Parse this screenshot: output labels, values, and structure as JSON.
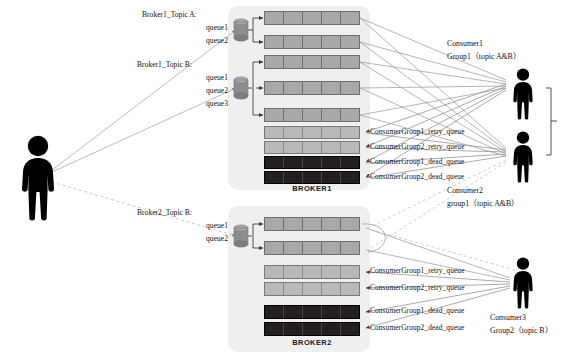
{
  "diagram": {
    "colors": {
      "broker_background": "#efeff0",
      "topic_queue_fill": "#a9a9a9",
      "retry_queue_fill": "#b9b9b9",
      "dead_queue_fill": "#231f20",
      "queue_border": "#6d6d6d",
      "person_fill": "#000000",
      "connector_line": "#9a9a9a",
      "text": "#111111"
    }
  },
  "producer": {
    "name": "producer-person-icon"
  },
  "topics": [
    {
      "id": "broker1-topic-a",
      "title": "Broker1_Topic A:",
      "queues": [
        "queue1",
        "queue2"
      ]
    },
    {
      "id": "broker1-topic-b",
      "title": "Broker1_Topic B:",
      "queues": [
        "queue1",
        "queue2",
        "queue3"
      ]
    },
    {
      "id": "broker2-topic-b",
      "title": "Broker2_Topic B:",
      "queues": [
        "queue1",
        "queue2"
      ]
    }
  ],
  "brokers": [
    {
      "id": "broker1",
      "label": "BROKER1",
      "bars": [
        {
          "kind": "topic",
          "cells": 5,
          "tag": ""
        },
        {
          "kind": "topic",
          "cells": 5,
          "tag": ""
        },
        {
          "kind": "topic",
          "cells": 5,
          "tag": ""
        },
        {
          "kind": "topic",
          "cells": 5,
          "tag": ""
        },
        {
          "kind": "topic",
          "cells": 5,
          "tag": ""
        },
        {
          "kind": "retry",
          "cells": 5,
          "tag": "ConsumerGroup1_retry_queue"
        },
        {
          "kind": "retry",
          "cells": 5,
          "tag": "ConsumerGroup2_retry_queue"
        },
        {
          "kind": "dead",
          "cells": 5,
          "tag": "ConsumerGroup1_dead_queue"
        },
        {
          "kind": "dead",
          "cells": 5,
          "tag": "ConsumerGroup2_dead_queue"
        }
      ]
    },
    {
      "id": "broker2",
      "label": "BROKER2",
      "bars": [
        {
          "kind": "topic",
          "cells": 5,
          "tag": ""
        },
        {
          "kind": "topic",
          "cells": 5,
          "tag": ""
        },
        {
          "kind": "retry",
          "cells": 5,
          "tag": "ConsumerGroup1_retry_queue"
        },
        {
          "kind": "retry",
          "cells": 5,
          "tag": "ConsumerGroup2_retry_queue"
        },
        {
          "kind": "dead",
          "cells": 5,
          "tag": "ConsumerGroup1_dead_queue"
        },
        {
          "kind": "dead",
          "cells": 5,
          "tag": "ConsumerGroup2_dead_queue"
        }
      ]
    }
  ],
  "consumers": [
    {
      "id": "consumer1",
      "name": "Consumer1",
      "group": "Group1（topic A&B）"
    },
    {
      "id": "consumer2",
      "name": "Consumer2",
      "group": "group1（topic A&B）"
    },
    {
      "id": "consumer3",
      "name": "Consumer3",
      "group": "Group2（topic B）"
    }
  ],
  "queue_tags": {
    "b1_retry1": "ConsumerGroup1_retry_queue",
    "b1_retry2": "ConsumerGroup2_retry_queue",
    "b1_dead1": "ConsumerGroup1_dead_queue",
    "b1_dead2": "ConsumerGroup2_dead_queue",
    "b2_retry1": "ConsumerGroup1_retry_queue",
    "b2_retry2": "ConsumerGroup2_retry_queue",
    "b2_dead1": "ConsumerGroup1_dead_queue",
    "b2_dead2": "ConsumerGroup2_dead_queue"
  }
}
